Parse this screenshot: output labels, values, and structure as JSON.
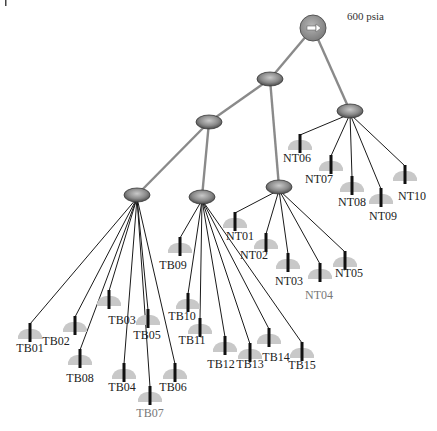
{
  "diagram": {
    "source": {
      "label": "600 psia",
      "icon": "arrow-right-icon",
      "x": 313,
      "y": 28,
      "r": 13,
      "label_x": 347,
      "label_y": 20
    },
    "junctions": [
      {
        "id": "J1",
        "x": 270,
        "y": 79,
        "parent": "SRC"
      },
      {
        "id": "J2",
        "x": 209,
        "y": 122,
        "parent": "J1"
      },
      {
        "id": "J3",
        "x": 137,
        "y": 195,
        "parent": "J2"
      },
      {
        "id": "J4",
        "x": 202,
        "y": 197,
        "parent": "J2"
      },
      {
        "id": "J5",
        "x": 279,
        "y": 187,
        "parent": "J1"
      },
      {
        "id": "J6",
        "x": 350,
        "y": 111,
        "parent": "SRC"
      }
    ],
    "sensors": [
      {
        "id": "TB01",
        "parent": "J3",
        "x": 30,
        "y": 330,
        "lx": 30,
        "ly": 352,
        "grey": false
      },
      {
        "id": "TB02",
        "parent": "J3",
        "x": 75,
        "y": 323,
        "lx": 56,
        "ly": 345,
        "grey": false
      },
      {
        "id": "TB03",
        "parent": "J3",
        "x": 109,
        "y": 297,
        "lx": 122,
        "ly": 324,
        "grey": false
      },
      {
        "id": "TB08",
        "parent": "J3",
        "x": 80,
        "y": 356,
        "lx": 80,
        "ly": 382,
        "grey": false
      },
      {
        "id": "TB05",
        "parent": "J3",
        "x": 148,
        "y": 316,
        "lx": 147,
        "ly": 339,
        "grey": false
      },
      {
        "id": "TB04",
        "parent": "J3",
        "x": 124,
        "y": 370,
        "lx": 122,
        "ly": 391,
        "grey": false
      },
      {
        "id": "TB07",
        "parent": "J3",
        "x": 150,
        "y": 393,
        "lx": 150,
        "ly": 417,
        "grey": true
      },
      {
        "id": "TB06",
        "parent": "J3",
        "x": 175,
        "y": 370,
        "lx": 173,
        "ly": 391,
        "grey": false
      },
      {
        "id": "TB09",
        "parent": "J4",
        "x": 180,
        "y": 244,
        "lx": 173,
        "ly": 269,
        "grey": false
      },
      {
        "id": "TB10",
        "parent": "J4",
        "x": 188,
        "y": 300,
        "lx": 182,
        "ly": 320,
        "grey": false
      },
      {
        "id": "TB11",
        "parent": "J4",
        "x": 200,
        "y": 325,
        "lx": 192,
        "ly": 344,
        "grey": false
      },
      {
        "id": "TB12",
        "parent": "J4",
        "x": 225,
        "y": 343,
        "lx": 221,
        "ly": 368,
        "grey": false
      },
      {
        "id": "TB13",
        "parent": "J4",
        "x": 250,
        "y": 350,
        "lx": 250,
        "ly": 368,
        "grey": false
      },
      {
        "id": "TB14",
        "parent": "J4",
        "x": 269,
        "y": 335,
        "lx": 276,
        "ly": 361,
        "grey": false
      },
      {
        "id": "TB15",
        "parent": "J4",
        "x": 302,
        "y": 349,
        "lx": 302,
        "ly": 369,
        "grey": false
      },
      {
        "id": "NT01",
        "parent": "J5",
        "x": 235,
        "y": 219,
        "lx": 240,
        "ly": 240,
        "grey": false
      },
      {
        "id": "NT02",
        "parent": "J5",
        "x": 266,
        "y": 240,
        "lx": 254,
        "ly": 259,
        "grey": false
      },
      {
        "id": "NT03",
        "parent": "J5",
        "x": 288,
        "y": 260,
        "lx": 289,
        "ly": 285,
        "grey": false
      },
      {
        "id": "NT04",
        "parent": "J5",
        "x": 320,
        "y": 270,
        "lx": 319,
        "ly": 299,
        "grey": true
      },
      {
        "id": "NT05",
        "parent": "J5",
        "x": 345,
        "y": 258,
        "lx": 349,
        "ly": 277,
        "grey": false
      },
      {
        "id": "NT06",
        "parent": "J6",
        "x": 300,
        "y": 141,
        "lx": 297,
        "ly": 162,
        "grey": false
      },
      {
        "id": "NT07",
        "parent": "J6",
        "x": 331,
        "y": 162,
        "lx": 319,
        "ly": 183,
        "grey": false
      },
      {
        "id": "NT08",
        "parent": "J6",
        "x": 352,
        "y": 183,
        "lx": 352,
        "ly": 206,
        "grey": false
      },
      {
        "id": "NT09",
        "parent": "J6",
        "x": 381,
        "y": 195,
        "lx": 383,
        "ly": 220,
        "grey": false
      },
      {
        "id": "NT10",
        "parent": "J6",
        "x": 405,
        "y": 172,
        "lx": 412,
        "ly": 200,
        "grey": false
      }
    ],
    "colors": {
      "trunk_line": "#8a8a8a",
      "branch_line": "#1a1a1a",
      "node_fill": "#8c8c8c",
      "node_stroke": "#3a3a3a",
      "sensor_body": "#c8c8c8",
      "sensor_stem": "#111111",
      "label": "#222222",
      "label_grey": "#777777"
    }
  }
}
